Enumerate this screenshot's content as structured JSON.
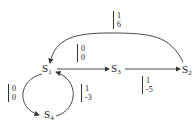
{
  "diagram": {
    "type": "state-transition",
    "nodes": [
      {
        "id": "S1",
        "label": "S",
        "sub": "1"
      },
      {
        "id": "S3",
        "label": "S",
        "sub": "3"
      },
      {
        "id": "S2",
        "label": "S",
        "sub": "2"
      },
      {
        "id": "S4",
        "label": "S",
        "sub": "4"
      }
    ],
    "edges": [
      {
        "from": "S2",
        "to": "S1",
        "top": "1",
        "bottom": "6"
      },
      {
        "from": "S1",
        "to": "S3",
        "top": "0",
        "bottom": "0"
      },
      {
        "from": "S3",
        "to": "S2",
        "top": "1",
        "bottom": "-5"
      },
      {
        "from": "S1",
        "to": "S4",
        "top": "0",
        "bottom": "0"
      },
      {
        "from": "S4",
        "to": "S1",
        "top": "1",
        "bottom": "-3"
      }
    ]
  }
}
